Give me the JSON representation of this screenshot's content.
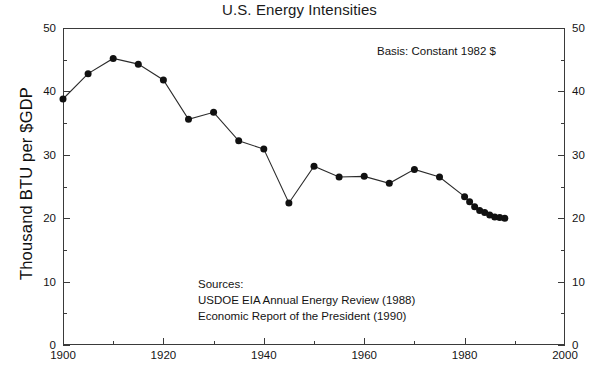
{
  "chart_data": {
    "type": "line",
    "title": "U.S. Energy Intensities",
    "xlabel": "",
    "ylabel": "Thousand BTU per $GDP",
    "xlim": [
      1900,
      2000
    ],
    "ylim": [
      0,
      50
    ],
    "grid": false,
    "legend": "none",
    "x_ticks": [
      1900,
      1920,
      1940,
      1960,
      1980,
      2000
    ],
    "x_tick_labels": [
      "1900",
      "1920",
      "1940",
      "1960",
      "1980",
      "2000"
    ],
    "x_minor_ticks": [
      1910,
      1930,
      1950,
      1970,
      1990
    ],
    "y_ticks": [
      0,
      10,
      20,
      30,
      40,
      50
    ],
    "y_tick_labels": [
      "0",
      "10",
      "20",
      "30",
      "40",
      "50"
    ],
    "y_minor_ticks": [
      5,
      15,
      25,
      35,
      45
    ],
    "y_axis_right_labels": [
      "0",
      "10",
      "20",
      "30",
      "40",
      "50"
    ],
    "annotations": [
      {
        "name": "basis",
        "text": "Basis:  Constant 1982 $"
      },
      {
        "name": "sources-heading",
        "text": "Sources:"
      },
      {
        "name": "sources-line-1",
        "text": "USDOE EIA Annual Energy Review (1988)"
      },
      {
        "name": "sources-line-2",
        "text": "Economic Report of the President (1990)"
      }
    ],
    "series": [
      {
        "name": "U.S. Energy Intensity",
        "marker": "filled-circle",
        "x": [
          1900,
          1905,
          1910,
          1915,
          1920,
          1925,
          1930,
          1935,
          1940,
          1945,
          1950,
          1955,
          1960,
          1965,
          1970,
          1975,
          1980,
          1981,
          1982,
          1983,
          1984,
          1985,
          1986,
          1987,
          1988
        ],
        "values": [
          38.8,
          42.8,
          45.2,
          44.3,
          41.8,
          35.6,
          36.7,
          32.2,
          30.9,
          22.4,
          28.2,
          26.5,
          26.6,
          25.5,
          27.7,
          26.5,
          23.4,
          22.6,
          21.8,
          21.2,
          20.9,
          20.5,
          20.2,
          20.1,
          20.0
        ]
      }
    ],
    "colors": {
      "line": "#2b2b2b",
      "marker": "#111111",
      "axis": "#3a3a3a",
      "text": "#141414",
      "background": "#ffffff"
    }
  }
}
